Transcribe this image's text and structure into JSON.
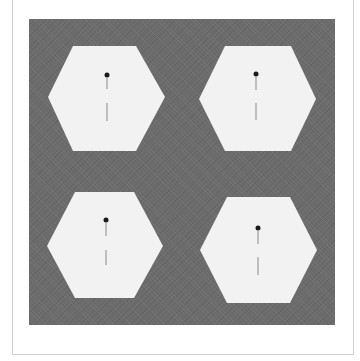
{
  "image": {
    "description": "Four white hexagons on a dark gray textured background, each with a small black dot and a thin vertical line",
    "colors": {
      "background": "#ffffff",
      "panel": "#6b6b6b",
      "hexagon_fill": "#f2f2f2",
      "marker": "#1a1a1a",
      "line": "#7a7a7a",
      "frame": "#cfcfcf"
    },
    "hexagons": [
      {
        "id": "top-left",
        "points": "73,46 136,46 165,97 136,151 73,151 48,97",
        "dot": [
          107,
          75
        ],
        "line_top": [
          107,
          78,
          107,
          89
        ],
        "line_bottom": [
          107,
          103,
          107,
          121
        ]
      },
      {
        "id": "top-right",
        "points": "225,46 291,46 316,99 291,151 225,151 199,99",
        "dot": [
          256,
          74
        ],
        "line_top": [
          256,
          77,
          256,
          90
        ],
        "line_bottom": [
          256,
          103,
          256,
          120
        ]
      },
      {
        "id": "bottom-left",
        "points": "75,192 134,192 163,246 134,298 75,298 47,246",
        "dot": [
          106,
          220
        ],
        "line_top": [
          106,
          223,
          106,
          236
        ],
        "line_bottom": [
          106,
          250,
          106,
          265
        ]
      },
      {
        "id": "bottom-right",
        "points": "227,197 290,197 317,250 290,303 227,303 200,250",
        "dot": [
          258,
          228
        ],
        "line_top": [
          258,
          231,
          258,
          244
        ],
        "line_bottom": [
          258,
          257,
          258,
          275
        ]
      }
    ]
  }
}
